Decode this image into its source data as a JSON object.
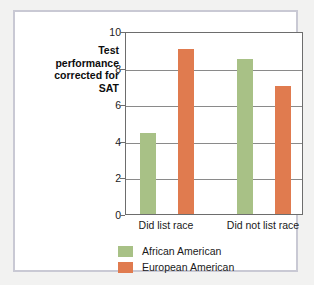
{
  "chart_data": {
    "type": "bar",
    "title": "",
    "xlabel": "",
    "ylabel": "Test performance corrected for SAT",
    "ylim": [
      0,
      10
    ],
    "ytick_values": [
      0,
      2,
      4,
      6,
      8,
      10
    ],
    "ytick_labels": [
      "0",
      "2",
      "4",
      "6",
      "8",
      "10"
    ],
    "grid": true,
    "legend_position": "bottom-left",
    "categories": [
      "Did list race",
      "Did not list race"
    ],
    "series": [
      {
        "name": "African American",
        "color": "#a8c186",
        "values": [
          4.4,
          8.45
        ]
      },
      {
        "name": "European American",
        "color": "#e07b4f",
        "values": [
          9.0,
          7.0
        ]
      }
    ]
  },
  "axis": {
    "y_title_line1": "Test",
    "y_title_line2": "performance",
    "y_title_line3": "corrected for",
    "y_title_line4": "SAT"
  },
  "colors": {
    "frame_border": "#c9c9d4",
    "plot_border": "#6d6d6d",
    "gridline": "#8a8a8a",
    "page_background": "#f2f2f1",
    "plot_background": "#ffffff"
  }
}
